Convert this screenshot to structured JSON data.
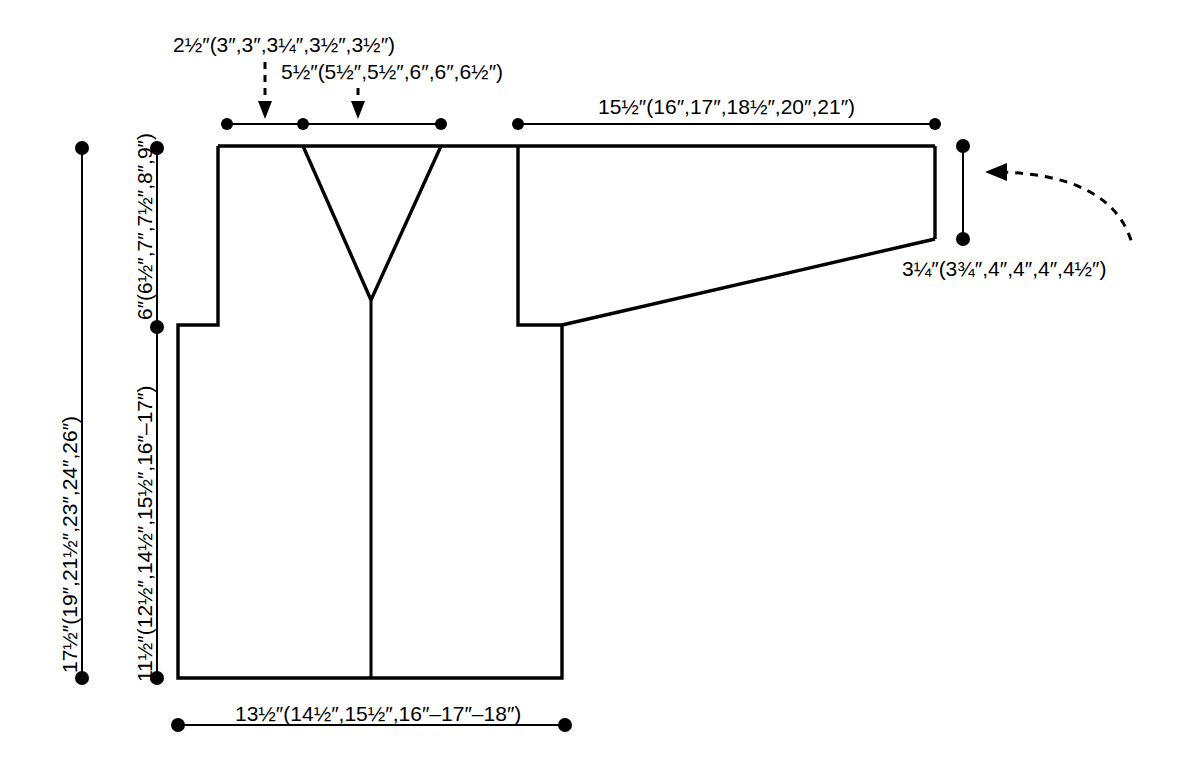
{
  "diagram": {
    "type": "knitting-pattern-schematic",
    "garment": "cardigan",
    "units": "inches",
    "line_color": "#000000",
    "background_color": "#ffffff",
    "size_count": 6
  },
  "measurements": {
    "shoulder_to_neck": {
      "id": "shoulder-width",
      "text": "2½″(3″,3″,3¼″,3½″,3½″)",
      "base": "2½″",
      "sizes": [
        "3″",
        "3″",
        "3¼″",
        "3½″",
        "3½″"
      ],
      "pointer": "dashed-arrow-down"
    },
    "neck_width": {
      "id": "neck-width",
      "text": "5½″(5½″,5½″,6″,6″,6½″)",
      "base": "5½″",
      "sizes": [
        "5½″",
        "5½″",
        "6″",
        "6″",
        "6½″"
      ],
      "pointer": "dashed-arrow-down"
    },
    "sleeve_length": {
      "id": "sleeve-length",
      "text": "15½″(16″,17″,18½″,20″,21″)",
      "base": "15½″",
      "sizes": [
        "16″",
        "17″",
        "18½″",
        "20″",
        "21″"
      ]
    },
    "cuff_width": {
      "id": "cuff-width",
      "text": "3¼″(3¾″,4″,4″,4″,4½″)",
      "base": "3¼″",
      "sizes": [
        "3¾″",
        "4″",
        "4″",
        "4″",
        "4½″"
      ],
      "pointer": "curved-dashed-arrow-left"
    },
    "total_length": {
      "id": "total-length",
      "text": "17½″(19″,21½″,23″,24″,26″)",
      "base": "17½″",
      "sizes": [
        "19″",
        "21½″",
        "23″",
        "24″",
        "26″"
      ]
    },
    "body_length": {
      "id": "body-length-below-armhole",
      "text": "11½″(12½″,14½″,15½″,16″–17″)",
      "base": "11½″",
      "sizes": [
        "12½″",
        "14½″",
        "15½″",
        "16″",
        "17″"
      ]
    },
    "armhole_depth": {
      "id": "armhole-depth",
      "text": "6″(6½″,7″,7½″,8″,9″)",
      "base": "6″",
      "sizes": [
        "6½″",
        "7″",
        "7½″",
        "8″",
        "9″"
      ]
    },
    "body_width": {
      "id": "body-width",
      "text": "13½″(14½″,15½″,16″–17″–18″)",
      "base": "13½″",
      "sizes": [
        "14½″",
        "15½″",
        "16″",
        "17″",
        "18″"
      ]
    }
  }
}
